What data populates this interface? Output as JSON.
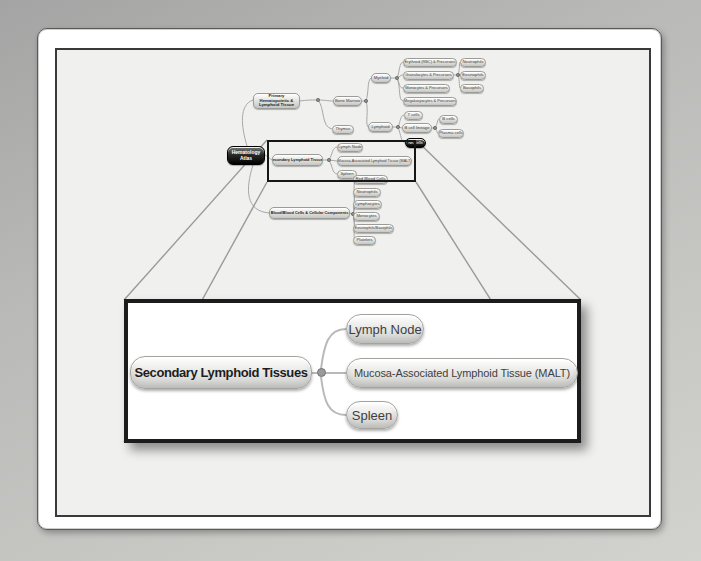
{
  "mindmap": {
    "root": "Hematology Atlas",
    "primary": "Primary Hematopoietic & Lymphoid Tissue",
    "bone_marrow": "Bone Marrow",
    "thymus": "Thymus",
    "myeloid": "Myeloid",
    "lymphoid": "Lymphoid",
    "erythroid": "Erythroid (RBC) & Precursors",
    "granulocytes": "Granulocytes & Precursors",
    "monocytes": "Monocytes & Precursors",
    "megakaryocytes": "Megakaryocytes & Precursors",
    "neutrophils": "Neutrophils",
    "eosinophils": "Eosinophils",
    "basophils": "Basophils",
    "t_cells": "T cells",
    "b_cell_lineage": "B cell lineage",
    "b_cells": "B cells",
    "plasma_cells": "Plasma cells",
    "nk_cells": "NK cells",
    "secondary": "Secondary Lymphoid Tissues",
    "secondary_children": [
      "Lymph Node",
      "Mucosa-Associated Lymphoid Tissue (MALT)",
      "Spleen"
    ],
    "blood": "Blood/Blood Cells & Cellular Components",
    "blood_children": [
      "Red Blood Cells",
      "Neutrophils",
      "Lymphocytes",
      "Monocytes",
      "Eosinophils/Basophils",
      "Platelets"
    ]
  },
  "inset": {
    "parent": "Secondary Lymphoid Tissues",
    "children": [
      "Lymph Node",
      "Mucosa-Associated Lymphoid Tissue (MALT)",
      "Spleen"
    ]
  },
  "colors": {
    "page_background": "#b9b9b7",
    "canvas_background": "#f0f0ee",
    "node_fill_top": "#ffffff",
    "node_fill_bottom": "#c6c6c3",
    "node_border": "#9b9b98",
    "node_text": "#3b3b3b",
    "root_node_fill": "#101010",
    "highlight_box": "#161616",
    "connector": "#a8a8a8"
  }
}
